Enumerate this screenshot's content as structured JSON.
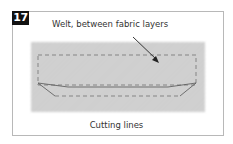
{
  "figure": {
    "step_number": "17",
    "top_label": "Welt, between fabric layers",
    "bottom_label": "Cutting lines"
  },
  "colors": {
    "badge_bg": "#111111",
    "fabric": "#cfcfcf",
    "frame_border": "#b8b8b8",
    "line": "#555555"
  }
}
